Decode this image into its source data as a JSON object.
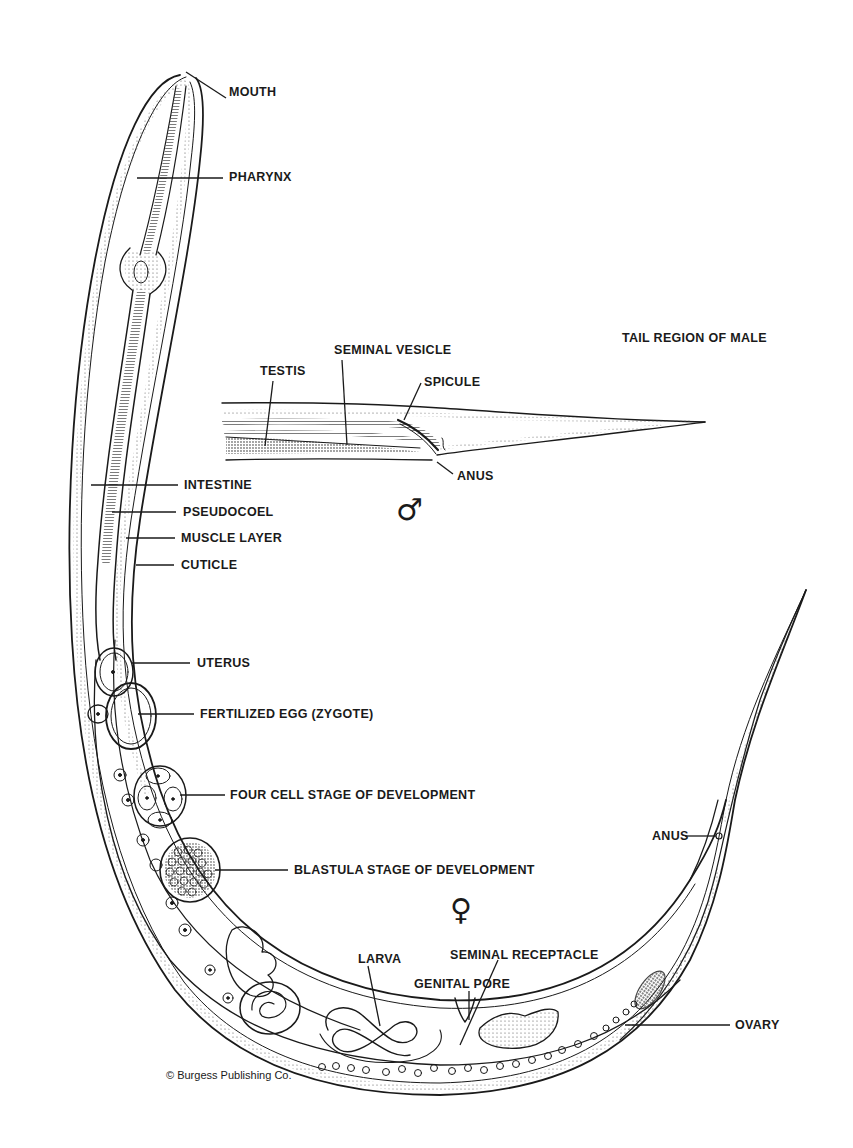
{
  "diagram": {
    "colors": {
      "ink": "#1a1a1a",
      "paper": "#ffffff",
      "stipple": "#555555"
    },
    "anterior_labels": [
      {
        "id": "mouth",
        "text": "MOUTH",
        "x": 229,
        "y": 92
      },
      {
        "id": "pharynx",
        "text": "PHARYNX",
        "x": 229,
        "y": 175
      }
    ],
    "body_wall_labels": [
      {
        "id": "intestine",
        "text": "INTESTINE",
        "x": 184,
        "y": 480
      },
      {
        "id": "pseudocoel",
        "text": "PSEUDOCOEL",
        "x": 183,
        "y": 508
      },
      {
        "id": "muscle-layer",
        "text": "MUSCLE LAYER",
        "x": 181,
        "y": 533
      },
      {
        "id": "cuticle",
        "text": "CUTICLE",
        "x": 181,
        "y": 560
      }
    ],
    "male_section": {
      "title": {
        "text": "TAIL REGION OF MALE",
        "x": 622,
        "y": 333
      },
      "symbol": "♂",
      "symbol_name": "male-symbol",
      "labels": [
        {
          "id": "testis",
          "text": "TESTIS",
          "x": 260,
          "y": 366
        },
        {
          "id": "seminal-vesicle",
          "text": "SEMINAL VESICLE",
          "x": 334,
          "y": 342
        },
        {
          "id": "spicule",
          "text": "SPICULE",
          "x": 424,
          "y": 378
        },
        {
          "id": "anus-male",
          "text": "ANUS",
          "x": 457,
          "y": 470
        }
      ]
    },
    "female_section": {
      "symbol": "♀",
      "symbol_name": "female-symbol",
      "labels": [
        {
          "id": "uterus",
          "text": "UTERUS",
          "x": 197,
          "y": 657
        },
        {
          "id": "fertilized-egg",
          "text": "FERTILIZED EGG (ZYGOTE)",
          "x": 200,
          "y": 708
        },
        {
          "id": "four-cell",
          "text": "FOUR CELL STAGE OF DEVELOPMENT",
          "x": 230,
          "y": 791
        },
        {
          "id": "blastula",
          "text": "BLASTULA STAGE OF DEVELOPMENT",
          "x": 294,
          "y": 866
        },
        {
          "id": "anus-female",
          "text": "ANUS",
          "x": 652,
          "y": 832
        },
        {
          "id": "seminal-receptacle",
          "text": "SEMINAL RECEPTACLE",
          "x": 450,
          "y": 948
        },
        {
          "id": "larva",
          "text": "LARVA",
          "x": 358,
          "y": 953
        },
        {
          "id": "genital-pore",
          "text": "GENITAL PORE",
          "x": 414,
          "y": 978
        },
        {
          "id": "ovary",
          "text": "OVARY",
          "x": 735,
          "y": 1020
        }
      ]
    },
    "credit": {
      "text": "© Burgess Publishing Co.",
      "x": 166,
      "y": 1068
    }
  }
}
